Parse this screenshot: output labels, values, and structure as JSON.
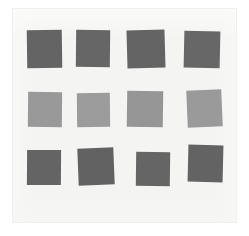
{
  "image": {
    "title": "Gray color swatch grid",
    "width": 249,
    "height": 236,
    "background_color": "#ffffff",
    "paper_color": "#f4f4f2",
    "paper_edge_color": "#f0f0ee"
  },
  "palette": {
    "dark_gray": "#646464",
    "dark_gray_alt": "#626262",
    "dark_gray_alt2": "#676767",
    "light_gray": "#999999",
    "light_gray_alt": "#9c9c9c",
    "light_gray_alt2": "#969696"
  },
  "grid": {
    "rows": 3,
    "columns": 4,
    "count": 12,
    "row_labels": [
      "top-row-dark",
      "middle-row-light",
      "bottom-row-dark"
    ]
  },
  "swatches": [
    {
      "id": "swatch-r1c1",
      "row": 1,
      "col": 1,
      "color": "#646464",
      "x": 27,
      "y": 30,
      "w": 35,
      "h": 38,
      "rotate": -0.8
    },
    {
      "id": "swatch-r1c2",
      "row": 1,
      "col": 2,
      "color": "#666666",
      "x": 76,
      "y": 30,
      "w": 34,
      "h": 37,
      "rotate": 0.6
    },
    {
      "id": "swatch-r1c3",
      "row": 1,
      "col": 3,
      "color": "#646464",
      "x": 127,
      "y": 30,
      "w": 38,
      "h": 38,
      "rotate": -1.6
    },
    {
      "id": "swatch-r1c4",
      "row": 1,
      "col": 4,
      "color": "#676767",
      "x": 184,
      "y": 31,
      "w": 36,
      "h": 37,
      "rotate": 1.2
    },
    {
      "id": "swatch-r2c1",
      "row": 2,
      "col": 1,
      "color": "#999999",
      "x": 28,
      "y": 92,
      "w": 34,
      "h": 35,
      "rotate": 0.5
    },
    {
      "id": "swatch-r2c2",
      "row": 2,
      "col": 2,
      "color": "#9c9c9c",
      "x": 77,
      "y": 93,
      "w": 33,
      "h": 34,
      "rotate": -0.6
    },
    {
      "id": "swatch-r2c3",
      "row": 2,
      "col": 3,
      "color": "#969696",
      "x": 127,
      "y": 91,
      "w": 36,
      "h": 36,
      "rotate": 0.8
    },
    {
      "id": "swatch-r2c4",
      "row": 2,
      "col": 4,
      "color": "#9a9a9a",
      "x": 187,
      "y": 90,
      "w": 35,
      "h": 37,
      "rotate": -2.4
    },
    {
      "id": "swatch-r3c1",
      "row": 3,
      "col": 1,
      "color": "#646464",
      "x": 27,
      "y": 150,
      "w": 34,
      "h": 35,
      "rotate": 0.4
    },
    {
      "id": "swatch-r3c2",
      "row": 3,
      "col": 2,
      "color": "#626262",
      "x": 78,
      "y": 148,
      "w": 36,
      "h": 37,
      "rotate": -2.2
    },
    {
      "id": "swatch-r3c3",
      "row": 3,
      "col": 3,
      "color": "#656565",
      "x": 136,
      "y": 152,
      "w": 34,
      "h": 34,
      "rotate": 0.7
    },
    {
      "id": "swatch-r3c4",
      "row": 3,
      "col": 4,
      "color": "#636363",
      "x": 188,
      "y": 145,
      "w": 35,
      "h": 37,
      "rotate": 1.4
    }
  ]
}
